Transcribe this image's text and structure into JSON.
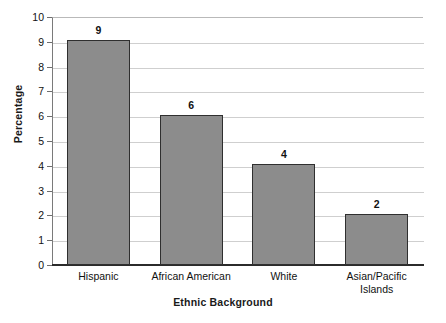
{
  "chart_data": {
    "type": "bar",
    "title": "",
    "xlabel": "Ethnic Background",
    "ylabel": "Percentage",
    "categories": [
      "Hispanic",
      "African American",
      "White",
      "Asian/Pacific Islands"
    ],
    "category_lines": [
      [
        "Hispanic"
      ],
      [
        "African American"
      ],
      [
        "White"
      ],
      [
        "Asian/Pacific",
        "Islands"
      ]
    ],
    "values": [
      9,
      6,
      4,
      2
    ],
    "value_labels": [
      "9",
      "6",
      "4",
      "2"
    ],
    "ylim": [
      0,
      10
    ],
    "yticks": [
      0,
      1,
      2,
      3,
      4,
      5,
      6,
      7,
      8,
      9,
      10
    ],
    "ytick_labels": [
      "0",
      "1",
      "2",
      "3",
      "4",
      "5",
      "6",
      "7",
      "8",
      "9",
      "10"
    ],
    "grid": "horizontal",
    "legend": "none",
    "bar_color": "#8c8c8c",
    "bar_edge_color": "#2f2f2f",
    "grid_color": "#cfcfcf",
    "axis_color": "#2b2b2b"
  },
  "caption": {
    "partial_text": ""
  }
}
